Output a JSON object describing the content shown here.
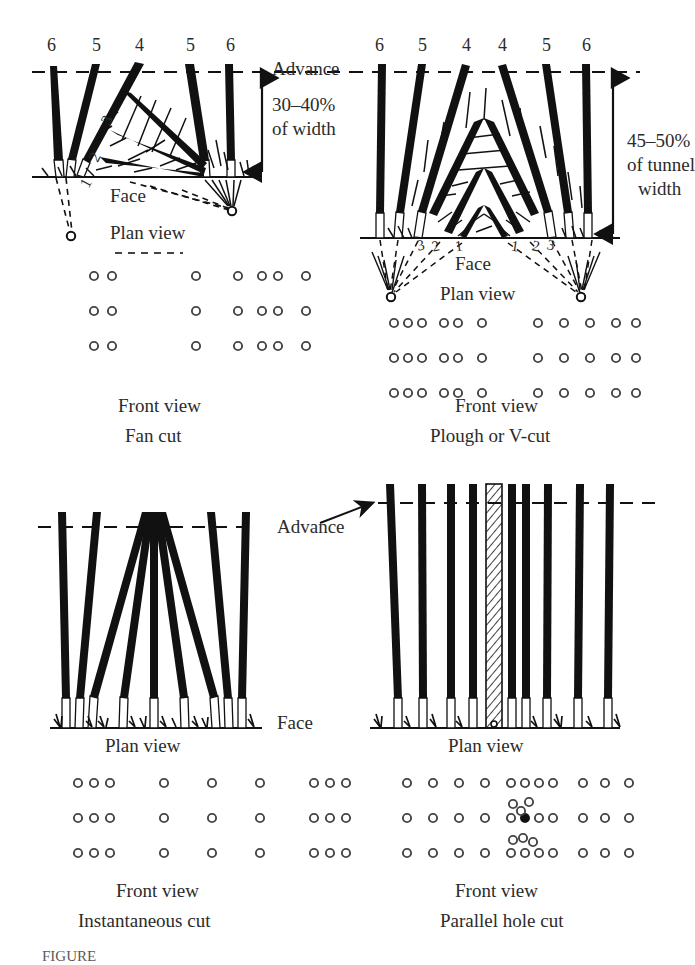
{
  "figure": {
    "caption": "FIGURE",
    "domain_title": "Tunnel blasting cut patterns"
  },
  "panels": [
    {
      "id": "fan-cut",
      "name": "Fan cut",
      "front_view_label": "Front view",
      "plan_view_label": "Plan view",
      "face_label": "Face",
      "advance_label": "Advance",
      "dimension_label_line1": "30–40%",
      "dimension_label_line2": "of width",
      "hole_numbers_top": [
        "6",
        "5",
        "4",
        "5",
        "6"
      ],
      "hole_numbers_inner": [
        "3",
        "2",
        "1"
      ],
      "front_view_rows": [
        [
          28,
          46,
          130,
          172,
          196,
          212,
          240
        ],
        [
          28,
          46,
          130,
          172,
          196,
          212,
          240
        ],
        [
          28,
          46,
          130,
          172,
          196,
          212,
          240
        ]
      ]
    },
    {
      "id": "plough-v-cut",
      "name": "Plough or V-cut",
      "front_view_label": "Front view",
      "plan_view_label": "Plan view",
      "face_label": "Face",
      "advance_label": "Advance",
      "dimension_label_line1": "45–50%",
      "dimension_label_line2": "of tunnel",
      "dimension_label_line3": "width",
      "hole_numbers_top": [
        "6",
        "5",
        "4",
        "4",
        "5",
        "6"
      ],
      "hole_numbers_left": [
        "3",
        "2",
        "1"
      ],
      "hole_numbers_right": [
        "1",
        "2",
        "3"
      ],
      "front_view_rows": [
        [
          8,
          22,
          36,
          58,
          72,
          96,
          152,
          178,
          204,
          230,
          250
        ],
        [
          8,
          22,
          36,
          58,
          72,
          96,
          152,
          178,
          204,
          230,
          250
        ],
        [
          8,
          22,
          36,
          58,
          72,
          96,
          152,
          178,
          204,
          230,
          250
        ]
      ]
    },
    {
      "id": "instantaneous-cut",
      "name": "Instantaneous cut",
      "front_view_label": "Front view",
      "plan_view_label": "Plan view",
      "face_label": "Face",
      "advance_label": "Advance",
      "front_view_rows": [
        [
          10,
          26,
          42,
          96,
          144,
          192,
          246,
          262,
          278
        ],
        [
          10,
          26,
          42,
          96,
          144,
          192,
          246,
          262,
          278
        ],
        [
          10,
          26,
          42,
          96,
          144,
          192,
          246,
          262,
          278
        ]
      ]
    },
    {
      "id": "parallel-hole-cut",
      "name": "Parallel hole cut",
      "front_view_label": "Front view",
      "plan_view_label": "Plan view",
      "advance_label": "Advance",
      "relief_hole_note": "hatched uncharged relief hole",
      "front_view_rows": [
        [
          6,
          32,
          58,
          84,
          110,
          124,
          138,
          152,
          182,
          204,
          228
        ],
        [
          6,
          32,
          58,
          84,
          110,
          124,
          138,
          152,
          182,
          204,
          228
        ],
        [
          6,
          32,
          58,
          84,
          110,
          124,
          138,
          152,
          182,
          204,
          228
        ]
      ],
      "center_filled_dot": true
    }
  ],
  "chart_data": {
    "type": "diagram",
    "panels": [
      "Fan cut",
      "Plough or V-cut",
      "Instantaneous cut",
      "Parallel hole cut"
    ],
    "annotations": [
      "Advance",
      "Face",
      "Plan view",
      "Front view",
      "30–40% of width",
      "45–50% of tunnel width"
    ]
  }
}
